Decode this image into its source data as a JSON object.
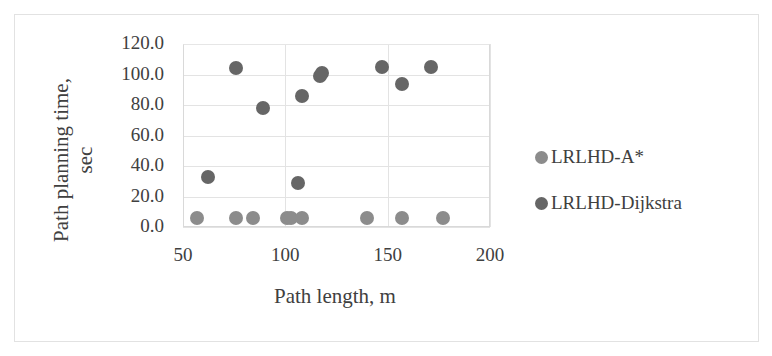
{
  "chart_data": {
    "type": "scatter",
    "title": "",
    "xlabel": "Path length, m",
    "ylabel": "Path planning time, sec",
    "xlim": [
      50,
      200
    ],
    "ylim": [
      0,
      120
    ],
    "x_ticks": [
      "50",
      "100",
      "150",
      "200"
    ],
    "y_ticks": [
      "0.0",
      "20.0",
      "40.0",
      "60.0",
      "80.0",
      "100.0",
      "120.0"
    ],
    "grid": true,
    "legend_position": "right",
    "series": [
      {
        "name": "LRLHD-A*",
        "color": "#8c8c8c",
        "points": [
          [
            57,
            6
          ],
          [
            76,
            6
          ],
          [
            84,
            6
          ],
          [
            101,
            6
          ],
          [
            103,
            6
          ],
          [
            108,
            6
          ],
          [
            140,
            6
          ],
          [
            157,
            6
          ],
          [
            177,
            6
          ]
        ]
      },
      {
        "name": "LRLHD-Dijkstra",
        "color": "#666666",
        "points": [
          [
            62,
            33
          ],
          [
            76,
            104
          ],
          [
            89,
            78
          ],
          [
            106,
            29
          ],
          [
            108,
            86
          ],
          [
            117,
            99
          ],
          [
            118,
            101
          ],
          [
            147,
            105
          ],
          [
            157,
            94
          ],
          [
            171,
            105
          ]
        ]
      }
    ]
  }
}
